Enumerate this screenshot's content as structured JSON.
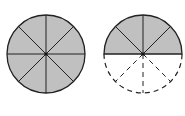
{
  "diagram": {
    "type": "fraction-circles",
    "fill_color": "#c0c0c0",
    "stroke_color": "#222222",
    "background": "#ffffff",
    "figures": [
      {
        "name": "whole-circle",
        "total_parts": 8,
        "shaded_parts": 8,
        "cx": 46,
        "cy": 54,
        "r": 39
      },
      {
        "name": "half-circle",
        "total_parts": 8,
        "shaded_parts": 4,
        "dashed_parts": 4,
        "cx": 143,
        "cy": 54,
        "r": 39
      }
    ]
  }
}
